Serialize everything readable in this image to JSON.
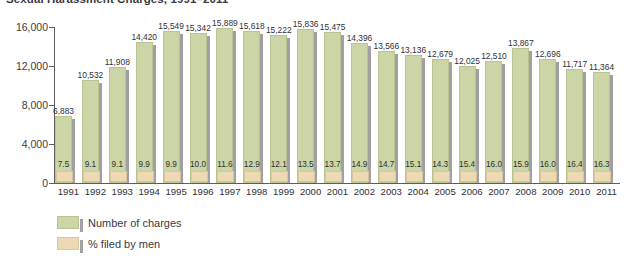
{
  "chart_data": {
    "type": "bar",
    "title": "Sexual Harassment Charges, 1991–2011",
    "xlabel": "",
    "ylabel": "",
    "ylim": [
      0,
      16000
    ],
    "yticks": [
      0,
      4000,
      8000,
      12000,
      16000
    ],
    "ytick_labels": [
      "0",
      "4,000",
      "8,000",
      "12,000",
      "16,000"
    ],
    "grid": false,
    "legend_position": "bottom-left",
    "categories": [
      "1991",
      "1992",
      "1993",
      "1994",
      "1995",
      "1996",
      "1997",
      "1998",
      "1999",
      "2000",
      "2001",
      "2002",
      "2003",
      "2004",
      "2005",
      "2006",
      "2007",
      "2008",
      "2009",
      "2010",
      "2011"
    ],
    "series": [
      {
        "name": "Number of charges",
        "color": "#ccd5a6",
        "values": [
          6883,
          10532,
          11908,
          14420,
          15549,
          15342,
          15889,
          15618,
          15222,
          15836,
          15475,
          14396,
          13566,
          13136,
          12679,
          12025,
          12510,
          13867,
          12696,
          11717,
          11364
        ],
        "labels": [
          "6,883",
          "10,532",
          "11,908",
          "14,420",
          "15,549",
          "15,342",
          "15,889",
          "15,618",
          "15,222",
          "15,836",
          "15,475",
          "14,396",
          "13,566",
          "13,136",
          "12,679",
          "12,025",
          "12,510",
          "13,867",
          "12,696",
          "11,717",
          "11,364"
        ]
      },
      {
        "name": "% filed by men",
        "color": "#edd9b4",
        "values": [
          7.5,
          9.1,
          9.1,
          9.9,
          9.9,
          10.0,
          11.6,
          12.9,
          12.1,
          13.5,
          13.7,
          14.9,
          14.7,
          15.1,
          14.3,
          15.4,
          16.0,
          15.9,
          16.0,
          16.4,
          16.3
        ],
        "labels": [
          "7.5",
          "9.1",
          "9.1",
          "9.9",
          "9.9",
          "10.0",
          "11.6",
          "12.9",
          "12.1",
          "13.5",
          "13.7",
          "14.9",
          "14.7",
          "15.1",
          "14.3",
          "15.4",
          "16.0",
          "15.9",
          "16.0",
          "16.4",
          "16.3"
        ]
      }
    ]
  },
  "legend": {
    "items": [
      {
        "label": "Number of charges",
        "swatch": "green"
      },
      {
        "label": "% filed by men",
        "swatch": "tan"
      }
    ]
  }
}
